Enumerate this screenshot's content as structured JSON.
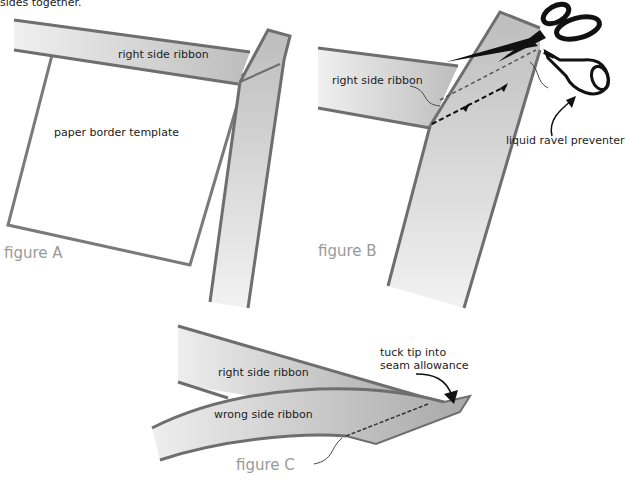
{
  "caption_fragment": "sides together.",
  "figures": [
    {
      "id": "A",
      "title": "figure A",
      "labels": {
        "ribbon": "right side ribbon",
        "template": "paper border template"
      }
    },
    {
      "id": "B",
      "title": "figure B",
      "labels": {
        "ribbon": "right side ribbon",
        "preventer": "liquid ravel preventer"
      }
    },
    {
      "id": "C",
      "title": "figure C",
      "labels": {
        "right_ribbon": "right side ribbon",
        "wrong_ribbon": "wrong side ribbon",
        "tuck": "tuck tip into",
        "tuck2": "seam allowance"
      }
    }
  ],
  "colors": {
    "outline": "#6e6e6e",
    "ribbon_light": "#f2f2f2",
    "ribbon_dark": "#c4c4c4",
    "figure_label": "#9a9a9a",
    "ink": "#111111"
  }
}
